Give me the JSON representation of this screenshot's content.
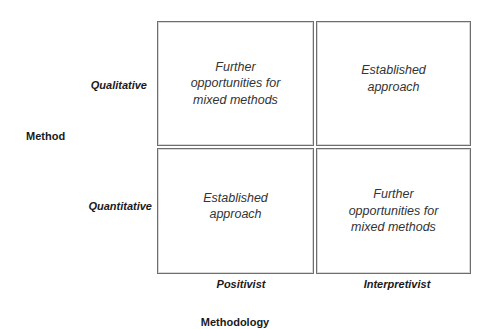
{
  "diagram": {
    "y_axis": {
      "title": "Method",
      "rows": [
        "Qualitative",
        "Quantitative"
      ]
    },
    "x_axis": {
      "title": "Methodology",
      "columns": [
        "Positivist",
        "Interpretivist"
      ]
    },
    "cells": [
      {
        "row": "Qualitative",
        "column": "Positivist",
        "text": "Further\nopportunities for\nmixed methods"
      },
      {
        "row": "Qualitative",
        "column": "Interpretivist",
        "text": "Established\napproach"
      },
      {
        "row": "Quantitative",
        "column": "Positivist",
        "text": "Established\napproach"
      },
      {
        "row": "Quantitative",
        "column": "Interpretivist",
        "text": "Further\nopportunities for\nmixed methods"
      }
    ]
  },
  "colors": {
    "border": "#6e6e6e",
    "text": "#333333",
    "label": "#1a1a1a",
    "background": "#ffffff"
  }
}
